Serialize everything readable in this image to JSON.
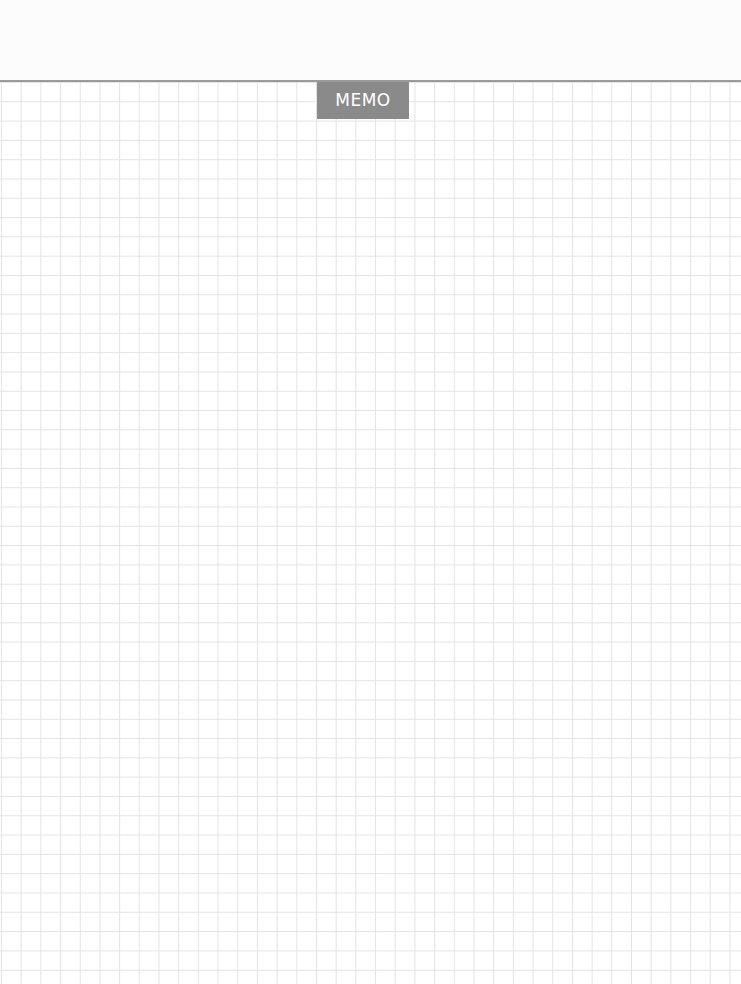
{
  "memo": {
    "label": "MEMO"
  },
  "colors": {
    "label_background": "#8a8a8a",
    "label_text": "#ffffff",
    "divider": "#9a9a9a",
    "grid_line": "#e3e3e3",
    "paper": "#ffffff"
  },
  "grid": {
    "cell_size_px": 19.5
  }
}
